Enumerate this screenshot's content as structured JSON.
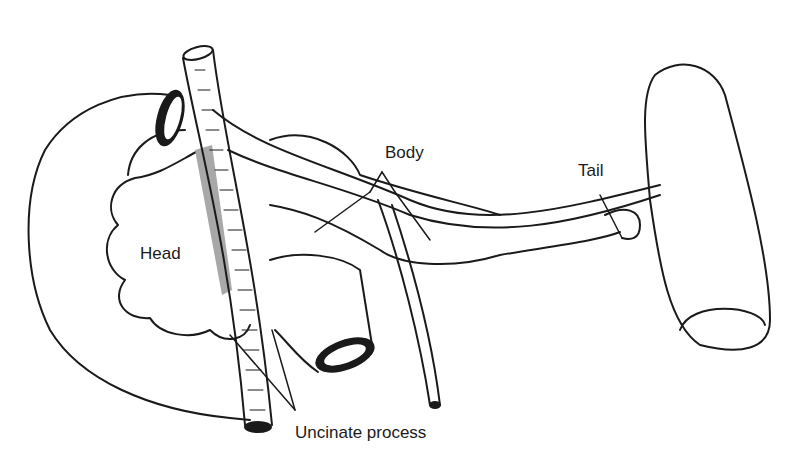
{
  "diagram": {
    "labels": {
      "head": "Head",
      "body": "Body",
      "tail": "Tail",
      "uncinate": "Uncinate process"
    },
    "colors": {
      "line": "#1a1a1a",
      "shade": "#a8a8a8",
      "background": "#ffffff"
    }
  }
}
